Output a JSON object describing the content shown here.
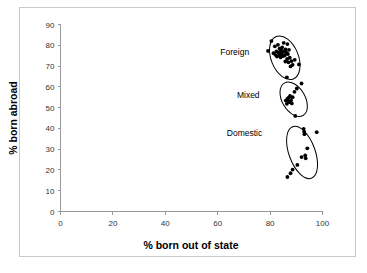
{
  "chart_data": {
    "type": "scatter",
    "title": "",
    "xlabel": "% born out of state",
    "ylabel": "% born abroad",
    "xlim": [
      0,
      100
    ],
    "ylim": [
      0,
      90
    ],
    "xticks": [
      0,
      20,
      40,
      60,
      80,
      100
    ],
    "yticks": [
      0,
      10,
      20,
      30,
      40,
      50,
      60,
      70,
      80,
      90
    ],
    "grid": false,
    "legend": "none",
    "point_color": "#000000",
    "ellipse_color": "#000000",
    "annotations": [
      {
        "text": "Foreign",
        "x": 72,
        "y": 77
      },
      {
        "text": "Mixed",
        "x": 76,
        "y": 56
      },
      {
        "text": "Domestic",
        "x": 77,
        "y": 38
      }
    ],
    "series": [
      {
        "name": "Foreign",
        "points": [
          [
            79.2,
            77.3
          ],
          [
            80.5,
            82.0
          ],
          [
            81.3,
            76.2
          ],
          [
            81.8,
            79.5
          ],
          [
            82.0,
            75.4
          ],
          [
            82.4,
            77.0
          ],
          [
            82.6,
            74.6
          ],
          [
            83.0,
            80.2
          ],
          [
            83.2,
            76.6
          ],
          [
            83.3,
            75.0
          ],
          [
            83.6,
            78.4
          ],
          [
            83.8,
            76.0
          ],
          [
            84.0,
            74.2
          ],
          [
            84.2,
            77.6
          ],
          [
            84.4,
            75.6
          ],
          [
            84.6,
            79.0
          ],
          [
            84.8,
            76.8
          ],
          [
            85.0,
            74.8
          ],
          [
            85.2,
            81.2
          ],
          [
            85.4,
            77.2
          ],
          [
            85.6,
            75.2
          ],
          [
            85.9,
            78.0
          ],
          [
            86.2,
            76.4
          ],
          [
            86.5,
            73.4
          ],
          [
            86.6,
            80.6
          ],
          [
            86.8,
            75.8
          ],
          [
            87.0,
            71.8
          ],
          [
            87.2,
            77.8
          ],
          [
            87.5,
            74.0
          ],
          [
            87.8,
            69.8
          ],
          [
            88.2,
            72.4
          ],
          [
            88.6,
            70.6
          ],
          [
            86.4,
            64.6
          ],
          [
            91.0,
            70.8
          ],
          [
            89.4,
            73.0
          ],
          [
            85.8,
            72.2
          ]
        ],
        "ellipse": {
          "cx": 85.6,
          "cy": 74.0,
          "rx": 5.2,
          "ry": 11.0,
          "angle": -22
        }
      },
      {
        "name": "Mixed",
        "points": [
          [
            86.0,
            53.4
          ],
          [
            86.4,
            51.8
          ],
          [
            86.6,
            54.2
          ],
          [
            86.9,
            53.0
          ],
          [
            87.1,
            54.8
          ],
          [
            87.4,
            52.6
          ],
          [
            87.6,
            55.6
          ],
          [
            88.0,
            53.6
          ],
          [
            88.3,
            52.0
          ],
          [
            88.6,
            55.0
          ],
          [
            89.3,
            57.6
          ],
          [
            90.2,
            59.2
          ],
          [
            92.0,
            61.6
          ],
          [
            89.6,
            46.0
          ]
        ],
        "ellipse": {
          "cx": 89.0,
          "cy": 54.0,
          "rx": 4.4,
          "ry": 9.0,
          "angle": -30
        }
      },
      {
        "name": "Domestic",
        "points": [
          [
            92.8,
            39.8
          ],
          [
            93.0,
            38.4
          ],
          [
            93.1,
            37.2
          ],
          [
            97.8,
            38.2
          ],
          [
            94.2,
            30.4
          ],
          [
            93.4,
            27.0
          ],
          [
            93.6,
            25.6
          ],
          [
            92.0,
            26.2
          ],
          [
            90.4,
            22.4
          ],
          [
            88.6,
            20.2
          ],
          [
            87.8,
            18.4
          ],
          [
            86.6,
            16.6
          ]
        ],
        "ellipse": {
          "cx": 92.2,
          "cy": 28.4,
          "rx": 5.0,
          "ry": 13.2,
          "angle": -20
        }
      }
    ]
  }
}
